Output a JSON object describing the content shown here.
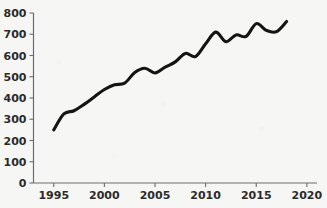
{
  "chart_data": {
    "type": "line",
    "title": "",
    "subtitle": "",
    "xlabel": "",
    "ylabel": "",
    "xlim": [
      1993,
      2021
    ],
    "ylim": [
      0,
      800
    ],
    "grid": false,
    "legend": false,
    "legend_position": "none",
    "line_color": "#141414",
    "axis_color": "#6c6c6c",
    "background_color": "#f6f6f5",
    "x_ticks": [
      1995,
      2000,
      2005,
      2010,
      2015,
      2020
    ],
    "x_tick_labels": [
      "1995",
      "2000",
      "2005",
      "2010",
      "2015",
      "2020"
    ],
    "y_ticks": [
      0,
      100,
      200,
      300,
      400,
      500,
      600,
      700,
      800
    ],
    "y_tick_labels": [
      "0",
      "100",
      "200",
      "300",
      "400",
      "500",
      "600",
      "700",
      "800"
    ],
    "series": [
      {
        "name": "series-1",
        "x": [
          1995,
          1996,
          1997,
          1998,
          1999,
          2000,
          2001,
          2002,
          2003,
          2004,
          2005,
          2006,
          2007,
          2008,
          2009,
          2010,
          2011,
          2012,
          2013,
          2014,
          2015,
          2016,
          2017,
          2018
        ],
        "values": [
          250,
          325,
          340,
          370,
          405,
          440,
          462,
          470,
          520,
          540,
          518,
          545,
          570,
          610,
          595,
          655,
          710,
          665,
          697,
          690,
          750,
          718,
          712,
          760
        ]
      }
    ]
  }
}
